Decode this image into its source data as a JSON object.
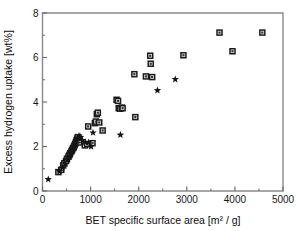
{
  "chart_data": {
    "type": "scatter",
    "title": "",
    "xlabel": "BET specific surface area [m² / g]",
    "ylabel": "Excess hydrogen uptake [wt%]",
    "xlim": [
      0,
      5000
    ],
    "ylim": [
      0,
      8
    ],
    "xticks": [
      0,
      1000,
      2000,
      3000,
      4000,
      5000
    ],
    "xtick_labels": [
      "0",
      "1000",
      "2000",
      "3000",
      "4000",
      "5000"
    ],
    "yticks": [
      0,
      2,
      4,
      6,
      8
    ],
    "ytick_labels": [
      "0",
      "2",
      "4",
      "6",
      "8"
    ],
    "x_minor_ticks": [
      500,
      1500,
      2500,
      3500,
      4500
    ],
    "y_minor_ticks": [
      1,
      3,
      5,
      7
    ],
    "grid": false,
    "legend": null,
    "legend_position": "none",
    "series": [
      {
        "name": "square-markers",
        "marker": "square",
        "points": [
          [
            330,
            0.85
          ],
          [
            390,
            0.95
          ],
          [
            430,
            1.15
          ],
          [
            455,
            1.25
          ],
          [
            490,
            1.35
          ],
          [
            510,
            1.45
          ],
          [
            540,
            1.55
          ],
          [
            560,
            1.62
          ],
          [
            575,
            1.7
          ],
          [
            600,
            1.78
          ],
          [
            615,
            1.85
          ],
          [
            635,
            1.92
          ],
          [
            650,
            1.98
          ],
          [
            665,
            2.05
          ],
          [
            680,
            2.12
          ],
          [
            695,
            2.2
          ],
          [
            710,
            2.28
          ],
          [
            720,
            2.35
          ],
          [
            735,
            2.42
          ],
          [
            745,
            2.3
          ],
          [
            760,
            2.18
          ],
          [
            880,
            2.05
          ],
          [
            930,
            2.1
          ],
          [
            950,
            2.9
          ],
          [
            1040,
            2.15
          ],
          [
            1090,
            3.05
          ],
          [
            1110,
            3.12
          ],
          [
            1130,
            3.45
          ],
          [
            1150,
            3.52
          ],
          [
            1180,
            3.08
          ],
          [
            1250,
            2.72
          ],
          [
            1540,
            4.1
          ],
          [
            1570,
            4.05
          ],
          [
            1585,
            3.72
          ],
          [
            1615,
            3.7
          ],
          [
            1650,
            3.75
          ],
          [
            1665,
            3.72
          ],
          [
            1910,
            5.25
          ],
          [
            1930,
            3.32
          ],
          [
            2150,
            5.15
          ],
          [
            2240,
            6.08
          ],
          [
            2250,
            5.72
          ],
          [
            2280,
            5.12
          ],
          [
            2930,
            6.1
          ],
          [
            3680,
            7.12
          ],
          [
            3950,
            6.28
          ],
          [
            4570,
            7.12
          ]
        ]
      },
      {
        "name": "star-markers",
        "marker": "star",
        "points": [
          [
            120,
            0.52
          ],
          [
            355,
            0.88
          ],
          [
            420,
            1.05
          ],
          [
            470,
            1.22
          ],
          [
            520,
            1.4
          ],
          [
            560,
            1.52
          ],
          [
            590,
            1.66
          ],
          [
            620,
            1.8
          ],
          [
            655,
            1.95
          ],
          [
            680,
            2.08
          ],
          [
            705,
            2.22
          ],
          [
            730,
            2.38
          ],
          [
            760,
            2.48
          ],
          [
            790,
            2.42
          ],
          [
            830,
            2.28
          ],
          [
            890,
            2.2
          ],
          [
            960,
            2.18
          ],
          [
            1010,
            2.0
          ],
          [
            1050,
            2.62
          ],
          [
            1620,
            2.52
          ],
          [
            2390,
            4.52
          ],
          [
            2760,
            5.02
          ]
        ]
      }
    ]
  }
}
